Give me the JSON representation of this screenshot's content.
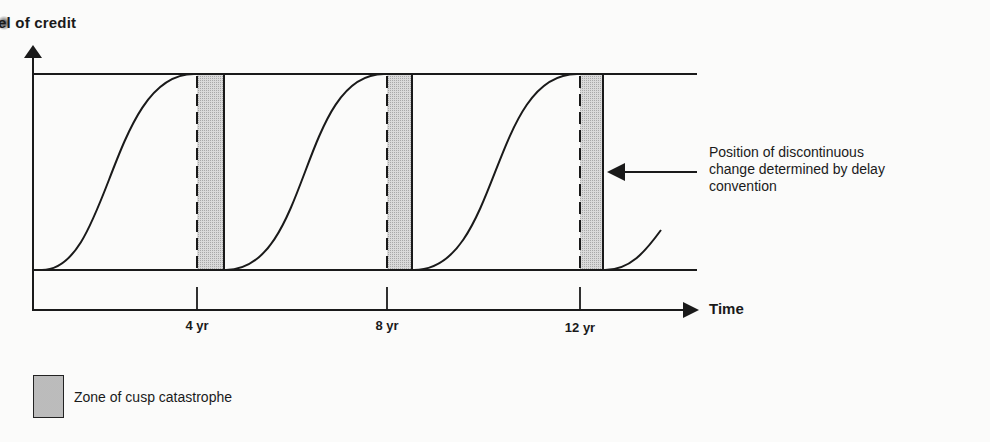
{
  "axes": {
    "y_label": "el of credit",
    "x_label": "Time"
  },
  "ticks": [
    {
      "label": "4 yr",
      "x": 197
    },
    {
      "label": "8 yr",
      "x": 387
    },
    {
      "label": "12 yr",
      "x": 580
    }
  ],
  "annotation": {
    "line1": "Position of discontinuous",
    "line2": "change determined by delay",
    "line3": "convention"
  },
  "legend": {
    "label": "Zone of cusp catastrophe"
  },
  "colors": {
    "line": "#1a1a1a",
    "zone_fill": "#d6d6d6",
    "background": "#fbfbfa"
  },
  "structure": {
    "cycles": 3,
    "curve_shape": "sigmoid rising from lower bound to upper bound, then discontinuous drop after cusp zone",
    "zones": [
      {
        "start_x": 197,
        "end_x": 224
      },
      {
        "start_x": 387,
        "end_x": 412
      },
      {
        "start_x": 580,
        "end_x": 603
      }
    ]
  }
}
